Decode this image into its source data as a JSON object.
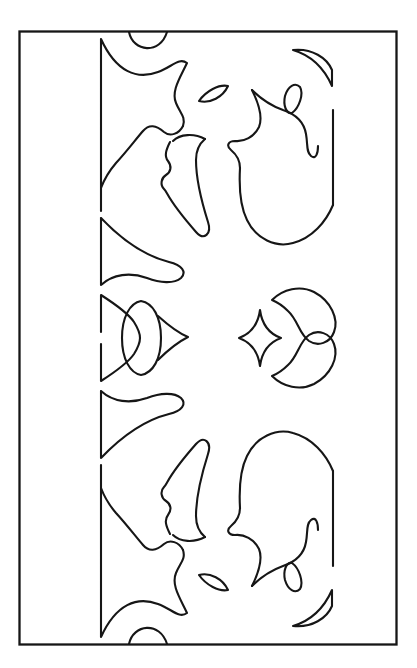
{
  "document": {
    "title": "Abstract Line-Art Pattern Plate",
    "kind": "line-drawing",
    "width": 417,
    "height": 668
  },
  "canvas": {
    "background_color": "#ffffff",
    "stroke_color": "#161616",
    "stroke_width": 2.1
  },
  "frame": {
    "name": "outer-rectangle-border",
    "x": 19,
    "y": 31,
    "width": 377,
    "height": 613,
    "stroke_color": "#161616"
  },
  "composition": {
    "symmetry": "mirror about horizontal axis y=338",
    "column_left_x": 100,
    "column_right_x": 333,
    "center_y": 338,
    "motif_count": 34
  },
  "motifs": [
    {
      "id": "top-arc-cap",
      "label": "small arc at top border"
    },
    {
      "id": "left-pennant-upper",
      "label": "upper left pennant blade"
    },
    {
      "id": "left-flare-upper",
      "label": "upper left flared wedge"
    },
    {
      "id": "left-dart-mid",
      "label": "middle left dart"
    },
    {
      "id": "left-trumpet",
      "label": "left trumpet horn"
    },
    {
      "id": "left-bulb-spur",
      "label": "left bulb with spur"
    },
    {
      "id": "leaf-small-upper-left",
      "label": "small lens leaf upper left"
    },
    {
      "id": "leaf-small-upper-right",
      "label": "small lens leaf upper right"
    },
    {
      "id": "right-crescent-upper",
      "label": "upper right crescent fin"
    },
    {
      "id": "right-flame",
      "label": "right flame form"
    },
    {
      "id": "right-lobe",
      "label": "right rounded lobe"
    },
    {
      "id": "center-star",
      "label": "four-pointed concave star"
    },
    {
      "id": "center-swirl-upper",
      "label": "upper curved sweep"
    },
    {
      "id": "center-swirl-lower",
      "label": "lower curved sweep"
    },
    {
      "id": "left-teardrop",
      "label": "left teardrop with point"
    },
    {
      "id": "bottom-arc-cap",
      "label": "small arc at bottom border"
    }
  ],
  "palette": {
    "ink": "#161616",
    "paper": "#ffffff"
  }
}
